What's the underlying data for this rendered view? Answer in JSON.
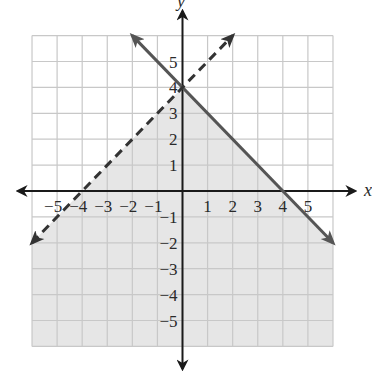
{
  "chart_data": {
    "type": "line",
    "title": "",
    "xlabel": "x",
    "ylabel": "y",
    "xlim": [
      -6,
      6
    ],
    "ylim": [
      -6,
      6
    ],
    "grid": true,
    "x_ticks": [
      -5,
      -4,
      -3,
      -2,
      -1,
      1,
      2,
      3,
      4,
      5
    ],
    "y_ticks": [
      -5,
      -4,
      -3,
      -2,
      -1,
      1,
      2,
      3,
      4,
      5
    ],
    "x_tick_labels": [
      "−5",
      "−4",
      "−3",
      "−2",
      "−1",
      "1",
      "2",
      "3",
      "4",
      "5"
    ],
    "y_tick_labels": [
      "−5",
      "−4",
      "−3",
      "−2",
      "−1",
      "1",
      "2",
      "3",
      "4",
      "5"
    ],
    "series": [
      {
        "name": "boundary-solid",
        "equation": "y = -x + 4",
        "style": "solid",
        "points": [
          [
            -2,
            6
          ],
          [
            6,
            -2
          ]
        ],
        "color": "#555555"
      },
      {
        "name": "boundary-dashed",
        "equation": "y = x + 4",
        "style": "dashed",
        "points": [
          [
            -6,
            -2
          ],
          [
            2,
            6
          ]
        ],
        "color": "#333333"
      }
    ],
    "shaded_region": {
      "description": "y < x + 4 and y <= -x + 4",
      "polygon": [
        [
          -6,
          -2
        ],
        [
          -6,
          -6
        ],
        [
          6,
          -6
        ],
        [
          6,
          -2
        ],
        [
          0,
          4
        ]
      ],
      "color": "#e6e6e6"
    }
  },
  "colors": {
    "grid": "#c8c8c8",
    "shade": "#e6e6e6",
    "axis": "#1a1a1a",
    "solid_line": "#555555",
    "dashed_line": "#333333"
  }
}
